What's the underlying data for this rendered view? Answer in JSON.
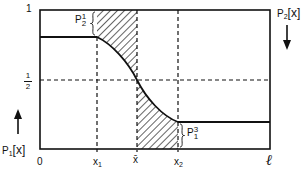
{
  "diagram": {
    "y_axis": {
      "label_top": "1",
      "label_half_num": "1",
      "label_half_den": "2",
      "left_variable": "P",
      "left_variable_sub": "1",
      "left_variable_arg": "[x]",
      "left_arrow": "up-arrow",
      "right_variable": "P",
      "right_variable_sub": "2",
      "right_variable_arg": "[x]",
      "right_arrow": "down-arrow"
    },
    "x_axis": {
      "origin": "0",
      "x1": "x",
      "x1_sub": "1",
      "xbar": "x̄",
      "x2": "x",
      "x2_sub": "2",
      "end": "ℓ"
    },
    "annotations": {
      "upper_brace_label": "P",
      "upper_brace_sub": "2",
      "upper_brace_sup": "1",
      "lower_brace_label": "P",
      "lower_brace_sub": "1",
      "lower_brace_sup": "3"
    },
    "colors": {
      "line": "#111111",
      "background": "#ffffff"
    }
  }
}
